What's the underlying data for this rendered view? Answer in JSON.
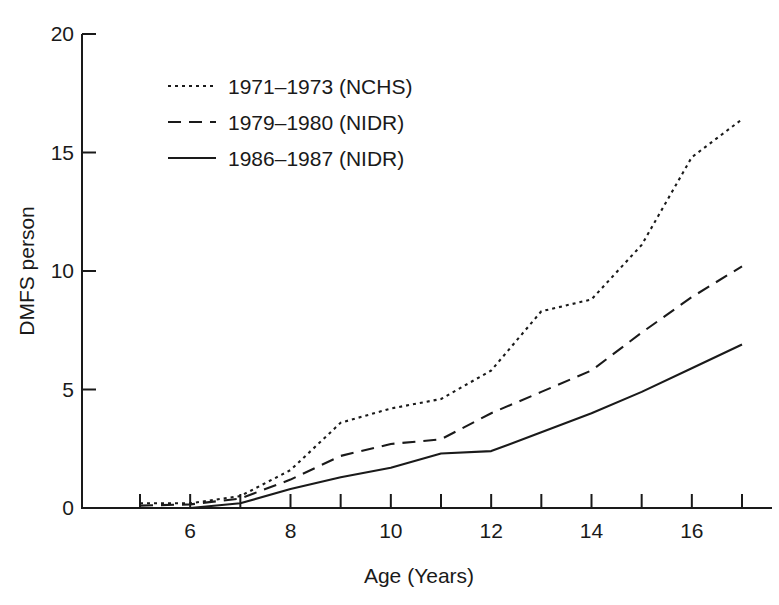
{
  "chart_data": {
    "type": "line",
    "title": "",
    "subtitle": "",
    "xlabel": "Age (Years)",
    "ylabel": "DMFS person",
    "xlim": [
      5,
      17
    ],
    "ylim": [
      0,
      20
    ],
    "grid": false,
    "legend_position": "top-left-inside",
    "x": [
      5,
      6,
      7,
      8,
      9,
      10,
      11,
      12,
      13,
      14,
      15,
      16,
      17
    ],
    "x_tick_values": [
      5,
      6,
      7,
      8,
      9,
      10,
      11,
      12,
      13,
      14,
      15,
      16,
      17
    ],
    "x_tick_labels": [
      "",
      "6",
      "",
      "8",
      "",
      "10",
      "",
      "12",
      "",
      "14",
      "",
      "16",
      ""
    ],
    "y_tick_values": [
      0,
      5,
      10,
      15,
      20
    ],
    "y_tick_labels": [
      "0",
      "5",
      "10",
      "15",
      "20"
    ],
    "series": [
      {
        "name": "1971–1973 (NCHS)",
        "style": "dotted",
        "color": "#1a1a1a",
        "values": [
          0.2,
          0.2,
          0.5,
          1.6,
          3.6,
          4.2,
          4.6,
          5.8,
          8.3,
          8.8,
          11.1,
          14.8,
          16.4
        ]
      },
      {
        "name": "1979–1980 (NIDR)",
        "style": "dashed",
        "color": "#1a1a1a",
        "values": [
          0.1,
          0.15,
          0.4,
          1.2,
          2.2,
          2.7,
          2.9,
          4.0,
          4.9,
          5.8,
          7.4,
          8.9,
          10.2
        ]
      },
      {
        "name": "1986–1987 (NIDR)",
        "style": "solid",
        "color": "#1a1a1a",
        "values": [
          0.0,
          0.0,
          0.2,
          0.8,
          1.3,
          1.7,
          2.3,
          2.4,
          3.2,
          4.0,
          4.9,
          5.9,
          6.9
        ]
      }
    ]
  },
  "axes": {
    "x_title": "Age (Years)",
    "y_title": "DMFS person"
  },
  "legend": {
    "entries": [
      {
        "label": "1971–1973 (NCHS)",
        "style": "dotted"
      },
      {
        "label": "1979–1980 (NIDR)",
        "style": "dashed"
      },
      {
        "label": "1986–1987 (NIDR)",
        "style": "solid"
      }
    ]
  },
  "colors": {
    "ink": "#1a1a1a",
    "background": "#ffffff"
  }
}
